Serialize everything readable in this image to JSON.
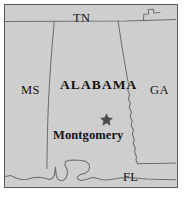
{
  "figure": {
    "kind": "reference-map",
    "subject": "Alabama",
    "frame_border_color": "#55585c",
    "land_fill_color": "#d2d2d2",
    "border_line_color": "#6b6e72",
    "label_color": "#111111",
    "page_background": "#ffffff"
  },
  "map": {
    "state_label": "ALABAMA",
    "capital": {
      "name": "Montgomery",
      "marker": "star-marker"
    },
    "neighbors": [
      {
        "id": "tn",
        "abbr": "TN",
        "position": "north"
      },
      {
        "id": "ms",
        "abbr": "MS",
        "position": "west"
      },
      {
        "id": "ga",
        "abbr": "GA",
        "position": "east"
      },
      {
        "id": "fl",
        "abbr": "FL",
        "position": "south"
      }
    ]
  }
}
